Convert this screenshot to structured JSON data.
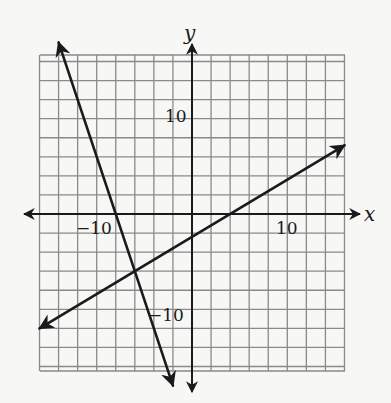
{
  "chart_data": {
    "type": "line",
    "title": "",
    "xlabel": "x",
    "ylabel": "y",
    "xlim": [
      -16,
      16
    ],
    "ylim": [
      -16.6,
      16.6
    ],
    "grid": true,
    "grid_step": 2,
    "tick_labels": {
      "x": [
        {
          "value": -10,
          "label": "−10"
        },
        {
          "value": 10,
          "label": "10"
        }
      ],
      "y": [
        {
          "value": 10,
          "label": "10"
        },
        {
          "value": -10,
          "label": "−10"
        }
      ]
    },
    "series": [
      {
        "name": "steep line",
        "equation": "y = -3x - 24",
        "points": [
          [
            -14,
            18
          ],
          [
            -8,
            0
          ],
          [
            -6,
            -6
          ],
          [
            -2,
            -18
          ]
        ],
        "arrows_both_ends": true,
        "color": "#1a1a1a"
      },
      {
        "name": "shallow line",
        "equation": "y = 0.6x - 2.4",
        "points": [
          [
            -16,
            -12
          ],
          [
            -6,
            -6
          ],
          [
            4,
            0
          ],
          [
            16,
            7.2
          ]
        ],
        "arrows_both_ends": true,
        "color": "#1a1a1a"
      }
    ],
    "intersection": [
      -6,
      -6
    ],
    "legend": null
  },
  "colors": {
    "background": "#f7f7f5",
    "grid": "#8a8a8a",
    "axis": "#1a1a1a",
    "line": "#1a1a1a"
  }
}
